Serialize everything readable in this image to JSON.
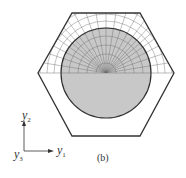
{
  "figure": {
    "caption": "(b)",
    "axes": {
      "y2": {
        "base": "y",
        "sub": "2"
      },
      "y1": {
        "base": "y",
        "sub": "1"
      },
      "y3": {
        "base": "y",
        "sub": "3"
      }
    },
    "colors": {
      "circle_fill": "#c8c8c8",
      "stroke": "#333333",
      "mesh": "#555555"
    }
  }
}
